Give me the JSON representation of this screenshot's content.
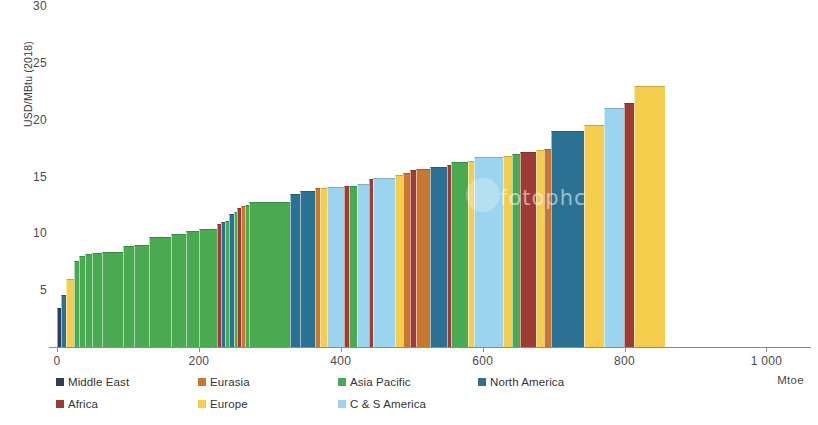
{
  "chart": {
    "type": "bar",
    "ylabel": "USD/MBtu (2018)",
    "xlabel": "Mtoe",
    "yticks": [
      "5",
      "10",
      "15",
      "20",
      "25",
      "30"
    ],
    "xticks": [
      "0",
      "200",
      "400",
      "600",
      "800",
      "1 000"
    ],
    "watermark": "fotophc"
  },
  "legend": {
    "items": [
      {
        "label": "Middle East",
        "color": "#2c3f55"
      },
      {
        "label": "Eurasia",
        "color": "#c9772f"
      },
      {
        "label": "Asia Pacific",
        "color": "#4aaa52"
      },
      {
        "label": "North America",
        "color": "#2b7193"
      },
      {
        "label": "Africa",
        "color": "#9e3b34"
      },
      {
        "label": "Europe",
        "color": "#f5cd4c"
      },
      {
        "label": "C & S America",
        "color": "#9ad4ee"
      }
    ]
  },
  "chart_data": {
    "type": "bar",
    "title": "",
    "subtitle": "",
    "xlabel": "Mtoe",
    "ylabel": "USD/MBtu (2018)",
    "xlim": [
      0,
      1060
    ],
    "ylim": [
      0,
      30
    ],
    "grid": false,
    "legend_position": "bottom-left",
    "note": "Cumulative supply-cost curve: each bar's width is a volume (Mtoe) and its height is a price (USD/MBtu); bars are laid end to end in ascending price order and coloured by region.",
    "categories": [
      "Middle East",
      "Eurasia",
      "Asia Pacific",
      "North America",
      "Africa",
      "Europe",
      "C & S America"
    ],
    "colors": {
      "Middle East": "#2c3f55",
      "Eurasia": "#c9772f",
      "Asia Pacific": "#4aaa52",
      "North America": "#2b7193",
      "Africa": "#9e3b34",
      "Europe": "#f5cd4c",
      "C & S America": "#9ad4ee"
    },
    "bars": [
      {
        "region": "Middle East",
        "start": 0,
        "width": 5,
        "value": 3.4
      },
      {
        "region": "North America",
        "start": 5,
        "width": 7,
        "value": 4.6
      },
      {
        "region": "Europe",
        "start": 12,
        "width": 12,
        "value": 6.0
      },
      {
        "region": "Asia Pacific",
        "start": 24,
        "width": 7,
        "value": 7.6
      },
      {
        "region": "Asia Pacific",
        "start": 31,
        "width": 8,
        "value": 8.0
      },
      {
        "region": "Asia Pacific",
        "start": 39,
        "width": 10,
        "value": 8.2
      },
      {
        "region": "Asia Pacific",
        "start": 49,
        "width": 14,
        "value": 8.3
      },
      {
        "region": "Asia Pacific",
        "start": 63,
        "width": 30,
        "value": 8.4
      },
      {
        "region": "Asia Pacific",
        "start": 93,
        "width": 15,
        "value": 8.9
      },
      {
        "region": "Asia Pacific",
        "start": 108,
        "width": 22,
        "value": 9.0
      },
      {
        "region": "Asia Pacific",
        "start": 130,
        "width": 30,
        "value": 9.7
      },
      {
        "region": "Asia Pacific",
        "start": 160,
        "width": 22,
        "value": 9.9
      },
      {
        "region": "Asia Pacific",
        "start": 182,
        "width": 18,
        "value": 10.2
      },
      {
        "region": "Asia Pacific",
        "start": 200,
        "width": 26,
        "value": 10.4
      },
      {
        "region": "Africa",
        "start": 226,
        "width": 5,
        "value": 10.8
      },
      {
        "region": "North America",
        "start": 231,
        "width": 6,
        "value": 11.0
      },
      {
        "region": "Asia Pacific",
        "start": 237,
        "width": 5,
        "value": 11.1
      },
      {
        "region": "North America",
        "start": 242,
        "width": 7,
        "value": 11.7
      },
      {
        "region": "Asia Pacific",
        "start": 249,
        "width": 5,
        "value": 11.9
      },
      {
        "region": "Africa",
        "start": 254,
        "width": 5,
        "value": 12.2
      },
      {
        "region": "Eurasia",
        "start": 259,
        "width": 6,
        "value": 12.4
      },
      {
        "region": "Asia Pacific",
        "start": 265,
        "width": 6,
        "value": 12.5
      },
      {
        "region": "Asia Pacific",
        "start": 271,
        "width": 58,
        "value": 12.8
      },
      {
        "region": "North America",
        "start": 329,
        "width": 14,
        "value": 13.5
      },
      {
        "region": "North America",
        "start": 343,
        "width": 20,
        "value": 13.7
      },
      {
        "region": "Eurasia",
        "start": 363,
        "width": 8,
        "value": 14.0
      },
      {
        "region": "Europe",
        "start": 371,
        "width": 9,
        "value": 14.0
      },
      {
        "region": "C & S America",
        "start": 380,
        "width": 24,
        "value": 14.1
      },
      {
        "region": "Africa",
        "start": 404,
        "width": 7,
        "value": 14.2
      },
      {
        "region": "Asia Pacific",
        "start": 411,
        "width": 12,
        "value": 14.2
      },
      {
        "region": "C & S America",
        "start": 423,
        "width": 17,
        "value": 14.3
      },
      {
        "region": "Africa",
        "start": 440,
        "width": 6,
        "value": 14.8
      },
      {
        "region": "C & S America",
        "start": 446,
        "width": 30,
        "value": 14.9
      },
      {
        "region": "Europe",
        "start": 476,
        "width": 12,
        "value": 15.1
      },
      {
        "region": "Eurasia",
        "start": 488,
        "width": 10,
        "value": 15.3
      },
      {
        "region": "Africa",
        "start": 498,
        "width": 8,
        "value": 15.6
      },
      {
        "region": "Eurasia",
        "start": 506,
        "width": 20,
        "value": 15.7
      },
      {
        "region": "North America",
        "start": 526,
        "width": 24,
        "value": 15.8
      },
      {
        "region": "Africa",
        "start": 550,
        "width": 6,
        "value": 16.0
      },
      {
        "region": "Asia Pacific",
        "start": 556,
        "width": 24,
        "value": 16.3
      },
      {
        "region": "Europe",
        "start": 580,
        "width": 8,
        "value": 16.4
      },
      {
        "region": "C & S America",
        "start": 588,
        "width": 40,
        "value": 16.7
      },
      {
        "region": "Europe",
        "start": 628,
        "width": 14,
        "value": 16.8
      },
      {
        "region": "Asia Pacific",
        "start": 642,
        "width": 11,
        "value": 17.0
      },
      {
        "region": "Africa",
        "start": 653,
        "width": 22,
        "value": 17.2
      },
      {
        "region": "Europe",
        "start": 675,
        "width": 12,
        "value": 17.3
      },
      {
        "region": "Eurasia",
        "start": 687,
        "width": 10,
        "value": 17.4
      },
      {
        "region": "North America",
        "start": 697,
        "width": 46,
        "value": 19.0
      },
      {
        "region": "Europe",
        "start": 743,
        "width": 28,
        "value": 19.5
      },
      {
        "region": "C & S America",
        "start": 771,
        "width": 28,
        "value": 21.0
      },
      {
        "region": "Africa",
        "start": 799,
        "width": 14,
        "value": 21.5
      },
      {
        "region": "Europe",
        "start": 813,
        "width": 44,
        "value": 23.0
      }
    ]
  }
}
